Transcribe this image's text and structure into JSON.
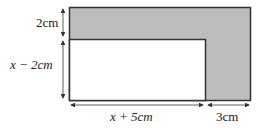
{
  "diagram": {
    "type": "area-diagram",
    "colors": {
      "shaded": "#bdbdbd",
      "stroke": "#333333",
      "background": "#ffffff"
    },
    "labels": {
      "top_strip_height": "2cm",
      "inner_height": "x − 2cm",
      "inner_width": "x + 5cm",
      "right_strip_width": "3cm"
    }
  }
}
